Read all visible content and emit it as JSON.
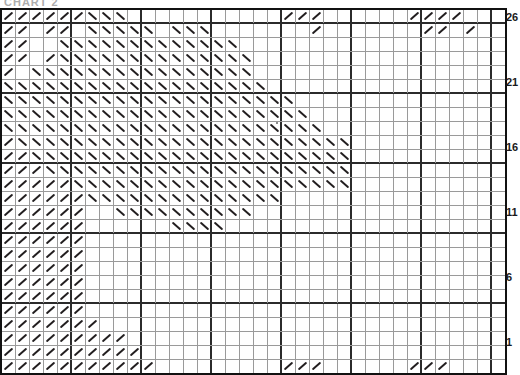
{
  "title_clipped": "CHART 2",
  "chart_data": {
    "type": "heatmap",
    "xlabel": "",
    "ylabel": "Row",
    "grid": true,
    "legend_position": "none",
    "columns": 36,
    "rows": 26,
    "bold_gridline_every": 5,
    "symbols": {
      "/": "right-slanting-decrease",
      "\\": "left-slanting-decrease",
      ".": "empty-stitch"
    },
    "row_tick_labels": [
      "26",
      "21",
      "16",
      "11",
      "6",
      "1"
    ],
    "row_tick_values": [
      26,
      21,
      16,
      11,
      6,
      1
    ],
    "categories": [
      "1",
      "2",
      "3",
      "4",
      "5",
      "6",
      "7",
      "8",
      "9",
      "10",
      "11",
      "12",
      "13",
      "14",
      "15",
      "16",
      "17",
      "18",
      "19",
      "20",
      "21",
      "22",
      "23",
      "24",
      "25",
      "26",
      "27",
      "28",
      "29",
      "30",
      "31",
      "32",
      "33",
      "34",
      "35",
      "36"
    ],
    "cells": [
      "//////\\\\\\...........///......////.....////////",
      "//.//.\\\\\\\\\\.\\\\\\......./.......//./......./../",
      "//..\\\\\\\\\\\\\\\\\\\\\\\\\\..................../..",
      "//./\\\\\\\\\\\\\\\\\\\\\\\\\\\\..................././",
      "/.\\\\\\\\\\\\\\\\\\\\\\\\\\\\\\\\.................../",
      "\\\\\\\\\\\\\\\\\\\\\\\\\\\\\\\\\\\\\\................./",
      "\\\\\\\\\\\\\\\\\\\\\\\\\\\\\\\\\\\\\\\\\\..............",
      "\\\\\\\\\\\\\\\\\\\\\\\\\\\\\\\\\\\\\\\\\\\\............",
      "\\\\\\\\\\\\\\\\\\\\\\\\\\\\\\\\\\\\\\\\\\\\\\.........",
      "/\\\\\\\\\\\\\\\\\\\\\\\\\\\\\\\\\\\\\\\\\\\\\\\\.......",
      "//\\\\\\\\\\\\\\\\\\\\\\\\\\\\\\\\\\\\\\\\\\\\\\.......",
      "///\\\\\\\\\\\\\\\\\\\\\\\\\\\\\\\\\\\\\\\\\\\\......",
      "/////\\\\\\\\\\\\\\\\\\\\\\\\\\\\\\\\\\\\\\\\.......",
      "//////\\\\\\\\\\\\\\\\\\\\\\\\\\\\.................",
      "//////..\\\\\\\\\\\\\\\\\\\\..................",
      "//////......\\\\\\\\..........................",
      "//////.............................",
      "//////..............................",
      "//////..............................",
      "//////..............................",
      "//////..............................",
      "//////..............................",
      "///////.............................",
      "/////////...........................",
      "//////////..........................",
      "///////////.........///......///....///"
    ],
    "note": "Each string is one row top-to-bottom; characters are column 1..36 left-to-right."
  }
}
